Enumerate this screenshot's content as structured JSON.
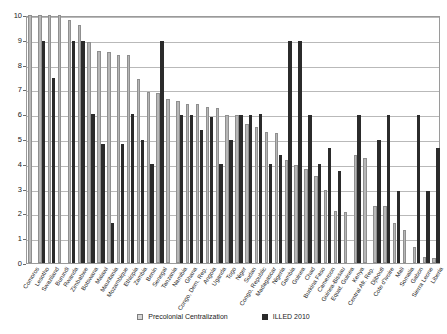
{
  "chart_data": {
    "type": "bar",
    "title": "",
    "subtitle": "",
    "xlabel": "",
    "ylabel": "",
    "ylim": [
      0,
      10
    ],
    "yticks": [
      0,
      1,
      2,
      3,
      4,
      5,
      6,
      7,
      8,
      9,
      10
    ],
    "grid": true,
    "legend_position": "bottom-center",
    "categories": [
      "Comoros",
      "Lesotho",
      "Swaziland",
      "Burundi",
      "Rwanda",
      "Zimbabwe",
      "Botswana",
      "Malawi",
      "Mauritania",
      "Mozambique",
      "Ethiopia",
      "Zambia",
      "Benin",
      "Senegal",
      "Tanzania",
      "Namibia",
      "Ghana",
      "Congo, Dem. Rep.",
      "Angola",
      "Uganda",
      "Togo",
      "Niger",
      "Sudan",
      "Congo, Republic",
      "Madagascar",
      "Nigeria",
      "Gambia",
      "Guinea",
      "Chad",
      "Burkina Faso",
      "Cameroon",
      "Guinea-Bissau",
      "Equat. Guinea",
      "Kenya",
      "Central Afr. Rep.",
      "Djibouti",
      "Cote d'Ivoire",
      "Mali",
      "Somalia",
      "Gabon",
      "Sierra Leone",
      "Liberia"
    ],
    "series": [
      {
        "name": "Precolonial Centralization",
        "color": "#b7b7b7",
        "values": [
          10.0,
          10.0,
          10.0,
          10.0,
          9.8,
          9.6,
          8.9,
          8.55,
          8.5,
          8.4,
          8.4,
          7.4,
          6.9,
          6.85,
          6.6,
          6.55,
          6.4,
          6.4,
          6.3,
          6.25,
          5.95,
          5.95,
          5.6,
          5.5,
          5.3,
          5.25,
          4.15,
          3.95,
          3.8,
          3.5,
          2.95,
          2.1,
          2.05,
          4.35,
          4.25,
          2.3,
          2.3,
          1.6,
          1.35,
          0.65,
          0.25,
          0.2
        ]
      },
      {
        "name": "ILLED 2010",
        "color": "#2b2b2b",
        "values": [
          0.0,
          8.95,
          7.45,
          0.0,
          8.95,
          8.95,
          6.0,
          4.8,
          1.6,
          4.8,
          6.0,
          4.95,
          4.0,
          8.95,
          0.0,
          5.95,
          5.95,
          5.35,
          5.9,
          4.0,
          4.95,
          5.95,
          5.95,
          6.0,
          4.0,
          4.35,
          8.95,
          8.95,
          5.95,
          4.0,
          4.65,
          3.7,
          0.0,
          5.95,
          0.0,
          4.95,
          5.95,
          2.9,
          0.0,
          5.95,
          2.9,
          4.65
        ]
      }
    ]
  },
  "legend": {
    "items": [
      {
        "label": "Precolonial Centralization",
        "style": "pre"
      },
      {
        "label": "ILLED 2010",
        "style": "illed"
      }
    ]
  }
}
